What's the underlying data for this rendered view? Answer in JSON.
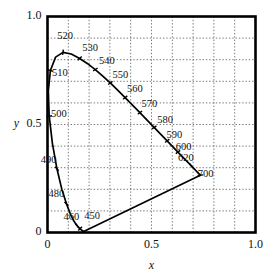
{
  "figure": {
    "kind": "cie-chromaticity-diagram",
    "background_color": "#ffffff",
    "line_color": "#000000",
    "grid_color": "#555555"
  },
  "axes": {
    "x_name": "x",
    "y_name": "y",
    "x_ticks": [
      "0",
      "0.5",
      "1.0"
    ],
    "y_ticks": [
      "0",
      "0.5",
      "1.0"
    ]
  },
  "chart_data": {
    "type": "line",
    "title": "",
    "xlabel": "x",
    "ylabel": "y",
    "xlim": [
      0,
      1
    ],
    "ylim": [
      0,
      1
    ],
    "xticks": [
      0,
      0.5,
      1
    ],
    "yticks": [
      0,
      0.5,
      1
    ],
    "xticklabels": [
      "0",
      "0.5",
      "1.0"
    ],
    "yticklabels": [
      "0",
      "0.5",
      "1.0"
    ],
    "grid": true,
    "grid_spacing": 0.1,
    "grid_style": "dotted",
    "legend": "none",
    "series": [
      {
        "name": "spectral locus",
        "closed": false,
        "x": [
          0.1741,
          0.174,
          0.1738,
          0.1736,
          0.1733,
          0.173,
          0.1726,
          0.1721,
          0.1714,
          0.1703,
          0.1689,
          0.1669,
          0.1644,
          0.1611,
          0.1566,
          0.151,
          0.144,
          0.1355,
          0.1241,
          0.1096,
          0.0913,
          0.0687,
          0.0454,
          0.0235,
          0.0082,
          0.0039,
          0.0139,
          0.0389,
          0.0743,
          0.1142,
          0.1547,
          0.1929,
          0.2296,
          0.2658,
          0.3016,
          0.3373,
          0.3731,
          0.4087,
          0.4441,
          0.4788,
          0.5125,
          0.5448,
          0.5752,
          0.6029,
          0.627,
          0.6482,
          0.6658,
          0.6801,
          0.6915,
          0.7006,
          0.7079,
          0.714,
          0.719,
          0.723,
          0.726,
          0.7283,
          0.73,
          0.7311,
          0.732,
          0.7327,
          0.7334,
          0.734,
          0.7344,
          0.7346,
          0.7347
        ],
        "y": [
          0.005,
          0.005,
          0.0049,
          0.0049,
          0.0048,
          0.0048,
          0.0048,
          0.0048,
          0.0051,
          0.0058,
          0.0069,
          0.0086,
          0.0109,
          0.0138,
          0.0177,
          0.0227,
          0.0297,
          0.0399,
          0.0578,
          0.0868,
          0.1327,
          0.2007,
          0.295,
          0.4127,
          0.5384,
          0.6548,
          0.7502,
          0.812,
          0.8338,
          0.8262,
          0.8059,
          0.7816,
          0.7543,
          0.7243,
          0.6923,
          0.6589,
          0.6245,
          0.5896,
          0.5547,
          0.5202,
          0.4866,
          0.4544,
          0.4242,
          0.3965,
          0.3725,
          0.3514,
          0.334,
          0.3197,
          0.3083,
          0.2993,
          0.292,
          0.2859,
          0.2809,
          0.277,
          0.274,
          0.2717,
          0.27,
          0.2689,
          0.268,
          0.2673,
          0.2666,
          0.266,
          0.2656,
          0.2654,
          0.2653
        ]
      },
      {
        "name": "purple line",
        "closed": false,
        "x": [
          0.1741,
          0.7347
        ],
        "y": [
          0.005,
          0.2653
        ]
      }
    ],
    "annotations": [
      {
        "label": "450",
        "x": 0.1566,
        "y": 0.0177,
        "label_x": 0.215,
        "label_y": 0.075,
        "tick": true
      },
      {
        "label": "460",
        "x": 0.144,
        "y": 0.0297,
        "label_x": 0.115,
        "label_y": 0.068,
        "tick": true
      },
      {
        "label": "480",
        "x": 0.0913,
        "y": 0.1327,
        "label_x": 0.043,
        "label_y": 0.175,
        "tick": true
      },
      {
        "label": "490",
        "x": 0.0454,
        "y": 0.295,
        "label_x": 0.005,
        "label_y": 0.335,
        "tick": true
      },
      {
        "label": "500",
        "x": 0.0082,
        "y": 0.5384,
        "label_x": 0.055,
        "label_y": 0.545,
        "tick": true
      },
      {
        "label": "510",
        "x": 0.0139,
        "y": 0.7502,
        "label_x": 0.06,
        "label_y": 0.735,
        "tick": true
      },
      {
        "label": "520",
        "x": 0.0743,
        "y": 0.8338,
        "label_x": 0.085,
        "label_y": 0.905,
        "tick": true
      },
      {
        "label": "530",
        "x": 0.1547,
        "y": 0.8059,
        "label_x": 0.205,
        "label_y": 0.85,
        "tick": true
      },
      {
        "label": "540",
        "x": 0.2296,
        "y": 0.7543,
        "label_x": 0.285,
        "label_y": 0.79,
        "tick": true
      },
      {
        "label": "550",
        "x": 0.3016,
        "y": 0.6923,
        "label_x": 0.35,
        "label_y": 0.725,
        "tick": true
      },
      {
        "label": "560",
        "x": 0.3731,
        "y": 0.6245,
        "label_x": 0.42,
        "label_y": 0.66,
        "tick": true
      },
      {
        "label": "570",
        "x": 0.4441,
        "y": 0.5547,
        "label_x": 0.49,
        "label_y": 0.59,
        "tick": true
      },
      {
        "label": "580",
        "x": 0.5125,
        "y": 0.4866,
        "label_x": 0.565,
        "label_y": 0.52,
        "tick": true
      },
      {
        "label": "590",
        "x": 0.5752,
        "y": 0.4242,
        "label_x": 0.61,
        "label_y": 0.45,
        "tick": true
      },
      {
        "label": "600",
        "x": 0.627,
        "y": 0.3725,
        "label_x": 0.655,
        "label_y": 0.392,
        "tick": true
      },
      {
        "label": "620",
        "x": 0.6915,
        "y": 0.3083,
        "label_x": 0.665,
        "label_y": 0.34,
        "tick": true
      },
      {
        "label": "700",
        "x": 0.7347,
        "y": 0.2653,
        "label_x": 0.76,
        "label_y": 0.268,
        "tick": true
      }
    ]
  }
}
